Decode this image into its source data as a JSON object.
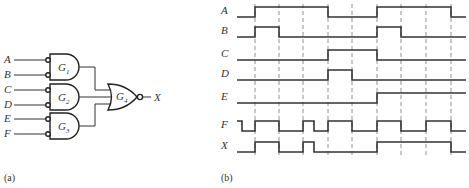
{
  "panel_a": {
    "caption": "(a)",
    "inputs": [
      "A",
      "B",
      "C",
      "D",
      "E",
      "F"
    ],
    "gates": [
      {
        "name": "G",
        "sub": "1",
        "type": "AND (inverted inputs)",
        "inputs": [
          "A",
          "B"
        ]
      },
      {
        "name": "G",
        "sub": "2",
        "type": "AND (inverted inputs)",
        "inputs": [
          "C",
          "D"
        ]
      },
      {
        "name": "G",
        "sub": "3",
        "type": "AND (inverted inputs)",
        "inputs": [
          "E",
          "F"
        ]
      },
      {
        "name": "G",
        "sub": "4",
        "type": "NOR",
        "inputs": [
          "G1",
          "G2",
          "G3"
        ]
      }
    ],
    "output": "X"
  },
  "panel_b": {
    "caption": "(b)",
    "signals": [
      "A",
      "B",
      "C",
      "D",
      "E",
      "F",
      "X"
    ],
    "time_marks": [
      255,
      279,
      303,
      328,
      352,
      377,
      401,
      426,
      451
    ],
    "waveforms": {
      "A": [
        [
          237,
          0
        ],
        [
          255,
          1
        ],
        [
          328,
          0
        ],
        [
          377,
          1
        ],
        [
          451,
          0
        ],
        [
          466,
          0
        ]
      ],
      "B": [
        [
          237,
          0
        ],
        [
          255,
          1
        ],
        [
          279,
          0
        ],
        [
          377,
          1
        ],
        [
          401,
          0
        ],
        [
          466,
          0
        ]
      ],
      "C": [
        [
          237,
          0
        ],
        [
          328,
          1
        ],
        [
          377,
          0
        ],
        [
          466,
          0
        ]
      ],
      "D": [
        [
          237,
          0
        ],
        [
          328,
          1
        ],
        [
          352,
          0
        ],
        [
          466,
          0
        ]
      ],
      "E": [
        [
          237,
          0
        ],
        [
          377,
          1
        ],
        [
          466,
          1
        ]
      ],
      "F": [
        [
          237,
          1
        ],
        [
          242,
          0
        ],
        [
          255,
          1
        ],
        [
          279,
          0
        ],
        [
          303,
          1
        ],
        [
          314,
          0
        ],
        [
          328,
          1
        ],
        [
          352,
          0
        ],
        [
          377,
          1
        ],
        [
          401,
          0
        ],
        [
          426,
          1
        ],
        [
          451,
          0
        ],
        [
          466,
          0
        ]
      ],
      "X": [
        [
          237,
          0
        ],
        [
          255,
          1
        ],
        [
          279,
          0
        ],
        [
          303,
          1
        ],
        [
          314,
          0
        ],
        [
          377,
          1
        ],
        [
          451,
          0
        ],
        [
          466,
          0
        ]
      ]
    }
  },
  "colors": {
    "line": "#333333",
    "dash": "#777777",
    "background": "#ffffff"
  }
}
